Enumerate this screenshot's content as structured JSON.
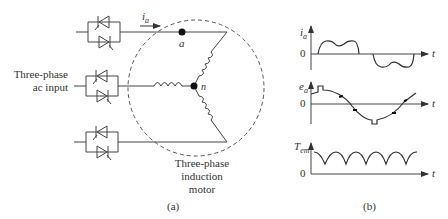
{
  "figure": {
    "part_a": {
      "caption": "(a)",
      "input_label_line1": "Three-phase",
      "input_label_line2": "ac input",
      "motor_label_line1": "Three-phase",
      "motor_label_line2": "induction",
      "motor_label_line3": "motor",
      "current_label": "i",
      "current_subscript": "a",
      "node_a_label": "a",
      "node_n_label": "n",
      "thyristor_pairs": 3
    },
    "part_b": {
      "caption": "(b)",
      "plots": [
        {
          "id": "current",
          "ylabel": "i",
          "ylabel_sub": "a",
          "xlabel": "t",
          "origin_label": "0"
        },
        {
          "id": "emf",
          "ylabel": "e",
          "ylabel_sub": "a",
          "xlabel": "t",
          "origin_label": "0"
        },
        {
          "id": "torque",
          "ylabel": "T",
          "ylabel_sub": "em",
          "xlabel": "t",
          "origin_label": "0"
        }
      ]
    },
    "colors": {
      "line": "#444444",
      "background": "#ffffff"
    }
  }
}
